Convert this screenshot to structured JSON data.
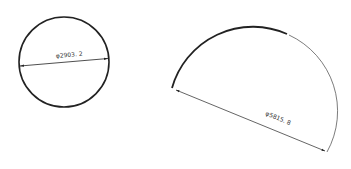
{
  "figures": [
    {
      "type": "full-circle",
      "dimension_label": "φ2903. 2",
      "stroke_color": "#222222"
    },
    {
      "type": "semicircular-arc",
      "dimension_label": "φ5815. 8",
      "stroke_color": "#222222"
    }
  ]
}
